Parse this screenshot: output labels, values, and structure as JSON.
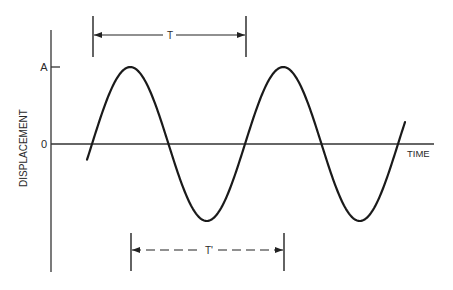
{
  "diagram": {
    "y_axis": {
      "label": "DISPLACEMENT",
      "ticks": [
        {
          "label": "A",
          "meaning": "amplitude"
        },
        {
          "label": "0",
          "meaning": "zero displacement"
        }
      ]
    },
    "x_axis": {
      "label": "TIME"
    },
    "period_markers": [
      {
        "label": "T",
        "style": "solid",
        "description": "period measured between successive upward zero crossings"
      },
      {
        "label": "T'",
        "style": "dashed",
        "description": "period measured between successive troughs"
      }
    ],
    "wave": {
      "type": "sine",
      "amplitude_label": "A",
      "cycles_shown": 2.1,
      "stroke_color": "#1a1a1a"
    },
    "colors": {
      "line": "#1a1a1a",
      "axis": "#333333",
      "background": "#ffffff"
    }
  }
}
